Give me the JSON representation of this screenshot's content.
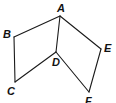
{
  "diagram": {
    "type": "geometry-figure",
    "vertices": [
      {
        "id": "A",
        "label": "A",
        "x": 60,
        "y": 16,
        "lx": 57,
        "ly": 12
      },
      {
        "id": "B",
        "label": "B",
        "x": 14,
        "y": 37,
        "lx": 3,
        "ly": 38
      },
      {
        "id": "C",
        "label": "C",
        "x": 15,
        "y": 82,
        "lx": 7,
        "ly": 95
      },
      {
        "id": "D",
        "label": "D",
        "x": 56,
        "y": 52,
        "lx": 52,
        "ly": 66
      },
      {
        "id": "E",
        "label": "E",
        "x": 101,
        "y": 49,
        "lx": 104,
        "ly": 52
      },
      {
        "id": "F",
        "label": "F",
        "x": 89,
        "y": 92,
        "lx": 85,
        "ly": 105
      }
    ],
    "edges": [
      [
        "A",
        "B"
      ],
      [
        "B",
        "C"
      ],
      [
        "C",
        "D"
      ],
      [
        "D",
        "A"
      ],
      [
        "A",
        "E"
      ],
      [
        "E",
        "F"
      ],
      [
        "F",
        "D"
      ]
    ],
    "stroke_color": "#1a1a1a"
  }
}
